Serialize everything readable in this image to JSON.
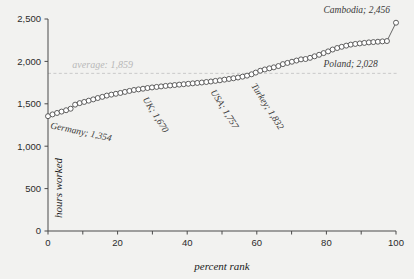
{
  "chart_data": {
    "type": "scatter",
    "title": "",
    "xlabel": "percent rank",
    "ylabel": "hours worked",
    "xlim": [
      0,
      100
    ],
    "ylim": [
      0,
      2500
    ],
    "grid": false,
    "legend": "none",
    "x_ticks": [
      0,
      10,
      20,
      30,
      40,
      50,
      60,
      70,
      80,
      90,
      100
    ],
    "x_tick_labels": [
      "0",
      "",
      "20",
      "",
      "40",
      "",
      "60",
      "",
      "80",
      "",
      "100"
    ],
    "y_ticks": [
      0,
      500,
      1000,
      1500,
      2000,
      2500
    ],
    "y_tick_labels": [
      "0",
      "500",
      "1,000",
      "1,500",
      "2,000",
      "2,500"
    ],
    "average_value": 1859,
    "average_label": "average: 1,859",
    "series": [
      {
        "name": "hours worked by percent rank",
        "marker": "open-circle",
        "x": [
          0,
          1.3,
          2.6,
          3.9,
          5.2,
          6.5,
          7.8,
          9.1,
          10.4,
          11.7,
          13,
          14.3,
          15.6,
          16.9,
          18.2,
          19.5,
          20.8,
          22.1,
          23.4,
          24.7,
          26,
          27.3,
          28.6,
          29.9,
          31.2,
          32.5,
          33.8,
          35.1,
          36.4,
          37.7,
          39,
          40.3,
          41.6,
          42.9,
          44.2,
          45.5,
          46.8,
          48.1,
          49.4,
          50.7,
          52,
          53.3,
          54.6,
          55.9,
          57.2,
          58.5,
          59.7,
          61,
          62.3,
          63.6,
          64.9,
          66.2,
          67.5,
          68.8,
          70.1,
          71.4,
          72.7,
          74,
          75.3,
          76.6,
          77.9,
          79.2,
          80.5,
          81.8,
          83.1,
          84.4,
          85.7,
          87,
          88.3,
          89.6,
          90.9,
          92.2,
          93.5,
          94.8,
          96.1,
          97.4,
          100
        ],
        "y": [
          1354,
          1375,
          1392,
          1408,
          1424,
          1442,
          1490,
          1508,
          1522,
          1537,
          1552,
          1568,
          1582,
          1597,
          1608,
          1618,
          1628,
          1640,
          1652,
          1663,
          1670,
          1678,
          1686,
          1693,
          1699,
          1705,
          1711,
          1716,
          1721,
          1726,
          1731,
          1736,
          1741,
          1746,
          1751,
          1757,
          1763,
          1770,
          1777,
          1785,
          1793,
          1801,
          1810,
          1820,
          1832,
          1848,
          1868,
          1890,
          1905,
          1918,
          1930,
          1945,
          1968,
          1982,
          1996,
          2010,
          2024,
          2028,
          2042,
          2060,
          2078,
          2098,
          2118,
          2140,
          2158,
          2172,
          2186,
          2198,
          2206,
          2212,
          2218,
          2224,
          2228,
          2232,
          2236,
          2240,
          2456
        ]
      }
    ],
    "annotations": [
      {
        "name": "germany",
        "label": "Germany; 1,354",
        "x": 0,
        "y": 1354
      },
      {
        "name": "uk",
        "label": "UK; 1,670",
        "x": 26,
        "y": 1670
      },
      {
        "name": "usa",
        "label": "USA; 1,757",
        "x": 45.5,
        "y": 1757
      },
      {
        "name": "turkey",
        "label": "Turkey; 1,832",
        "x": 57.2,
        "y": 1832
      },
      {
        "name": "poland",
        "label": "Poland; 2,028",
        "x": 74,
        "y": 2028
      },
      {
        "name": "cambodia",
        "label": "Cambodia; 2,456",
        "x": 100,
        "y": 2456
      }
    ],
    "colors": {
      "background": "#f2f2f0",
      "marker_fill": "#ffffff",
      "marker_stroke": "#4d4d4d",
      "line": "#585858",
      "axis": "#4a4a4a",
      "average_line": "#c9c9c9",
      "average_text": "#b8b8b8",
      "annotation_text": "#3a3a3a"
    }
  }
}
